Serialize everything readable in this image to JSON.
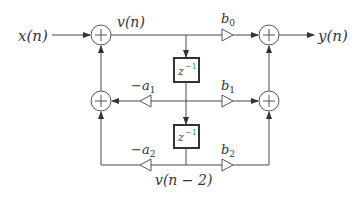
{
  "diagram": {
    "type": "biquad-direct-form-II",
    "input_label": "x(n)",
    "output_label": "y(n)",
    "state_label_top": "v(n)",
    "state_label_bottom": "v(n − 2)",
    "delay_label": "z",
    "delay_exponent": "−1",
    "gains": {
      "b0": "b",
      "b0_sub": "0",
      "b1": "b",
      "b1_sub": "1",
      "b2": "b",
      "b2_sub": "2",
      "a1": "−a",
      "a1_sub": "1",
      "a2": "−a",
      "a2_sub": "2"
    },
    "adder_symbol": "+",
    "colors": {
      "line": "#4a4a4a",
      "box_border": "#333333",
      "exponent_accent": "#2e9e2e",
      "text": "#333333"
    }
  }
}
